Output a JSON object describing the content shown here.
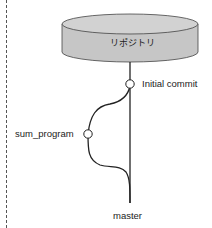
{
  "diagram": {
    "repository_label": "リポジトリ",
    "commit_label": "Initial commit",
    "branch_label": "sum_program",
    "main_branch_label": "master",
    "colors": {
      "cylinder_fill": "#c8c8c8",
      "cylinder_top": "#d4d4d4",
      "line": "#222222",
      "node_fill": "#ffffff"
    }
  }
}
